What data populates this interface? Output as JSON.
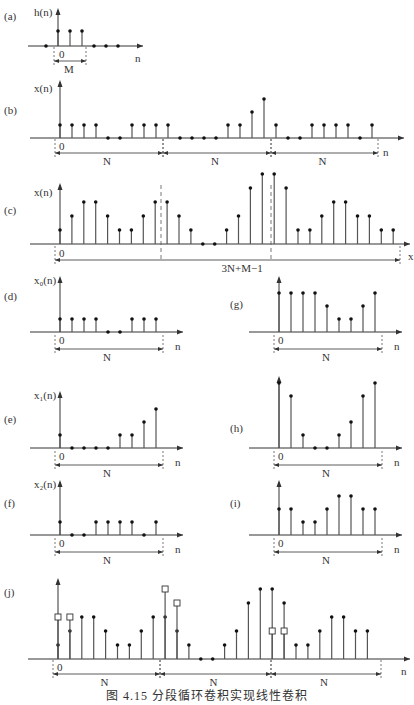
{
  "figure": {
    "caption": "图 4.15    分段循环卷积实现线性卷积",
    "panels": [
      {
        "id": "a",
        "tag": "(a)",
        "ylabel": "h(n)",
        "xlabel": "n",
        "span_labels": [
          "M"
        ]
      },
      {
        "id": "b",
        "tag": "(b)",
        "ylabel": "x(n)",
        "xlabel": "n",
        "span_labels": [
          "N",
          "N",
          "N"
        ]
      },
      {
        "id": "c",
        "tag": "(c)",
        "ylabel": "x(n)",
        "xlabel": "x",
        "span_labels": [
          "3N+M−1"
        ]
      },
      {
        "id": "d",
        "tag": "(d)",
        "ylabel": "x₀(n)",
        "xlabel": "n",
        "span_labels": [
          "N"
        ]
      },
      {
        "id": "e",
        "tag": "(e)",
        "ylabel": "x₁(n)",
        "xlabel": "n",
        "span_labels": [
          "N"
        ]
      },
      {
        "id": "f",
        "tag": "(f)",
        "ylabel": "x₂(n)",
        "xlabel": "n",
        "span_labels": [
          "N"
        ]
      },
      {
        "id": "g",
        "tag": "(g)",
        "ylabel": "",
        "xlabel": "n",
        "span_labels": [
          "N"
        ]
      },
      {
        "id": "h",
        "tag": "(h)",
        "ylabel": "",
        "xlabel": "n",
        "span_labels": [
          "N"
        ]
      },
      {
        "id": "i",
        "tag": "(i)",
        "ylabel": "",
        "xlabel": "n",
        "span_labels": [
          "N"
        ]
      },
      {
        "id": "j",
        "tag": "(j)",
        "ylabel": "",
        "xlabel": "n",
        "span_labels": [
          "N",
          "N",
          "N"
        ]
      }
    ],
    "origin_label": "0"
  },
  "chart_data": [
    {
      "panel": "a",
      "type": "stem",
      "title": "h(n)",
      "x": [
        -1,
        0,
        1,
        2,
        3,
        4,
        5
      ],
      "values": [
        0,
        1,
        1,
        1,
        0,
        0,
        0
      ]
    },
    {
      "panel": "b",
      "type": "stem",
      "title": "x(n)",
      "values": [
        1,
        1,
        1,
        1,
        0,
        0,
        1,
        1,
        1,
        1,
        0,
        0,
        0,
        0,
        1,
        1,
        2,
        3,
        1,
        0,
        0,
        1,
        1,
        1,
        1,
        0,
        1
      ]
    },
    {
      "panel": "c",
      "type": "stem",
      "title": "x(n)*h(n)",
      "values": [
        1,
        2,
        3,
        3,
        2,
        1,
        1,
        2,
        3,
        3,
        2,
        1,
        0,
        0,
        1,
        2,
        4,
        5,
        5,
        4,
        1,
        1,
        2,
        3,
        3,
        2,
        2,
        1,
        1
      ]
    },
    {
      "panel": "d",
      "type": "stem",
      "title": "x0(n)",
      "values": [
        1,
        1,
        1,
        1,
        0,
        0,
        1,
        1,
        1
      ]
    },
    {
      "panel": "e",
      "type": "stem",
      "title": "x1(n)",
      "values": [
        1,
        0,
        0,
        0,
        0,
        1,
        1,
        2,
        3
      ]
    },
    {
      "panel": "f",
      "type": "stem",
      "title": "x2(n)",
      "values": [
        1,
        0,
        0,
        1,
        1,
        1,
        1,
        0,
        1
      ]
    },
    {
      "panel": "g",
      "type": "stem",
      "title": "x0 ⊛ h",
      "values": [
        3,
        3,
        3,
        3,
        2,
        1,
        1,
        2,
        3
      ]
    },
    {
      "panel": "h",
      "type": "stem",
      "title": "x1 ⊛ h",
      "values": [
        5,
        4,
        1,
        0,
        0,
        1,
        2,
        4,
        5
      ]
    },
    {
      "panel": "i",
      "type": "stem",
      "title": "x2 ⊛ h",
      "values": [
        2,
        2,
        1,
        1,
        2,
        3,
        3,
        2,
        2
      ]
    },
    {
      "panel": "j",
      "type": "stem",
      "title": "overlap result",
      "values": [
        1,
        2,
        3,
        3,
        2,
        1,
        1,
        2,
        3,
        3,
        2,
        1,
        0,
        0,
        1,
        2,
        4,
        5,
        5,
        4,
        1,
        1,
        2,
        3,
        3,
        2,
        2
      ],
      "aliased_squares": [
        {
          "n": 0,
          "v": 3
        },
        {
          "n": 1,
          "v": 3
        },
        {
          "n": 9,
          "v": 5
        },
        {
          "n": 10,
          "v": 4
        },
        {
          "n": 18,
          "v": 2
        },
        {
          "n": 19,
          "v": 2
        }
      ]
    }
  ]
}
